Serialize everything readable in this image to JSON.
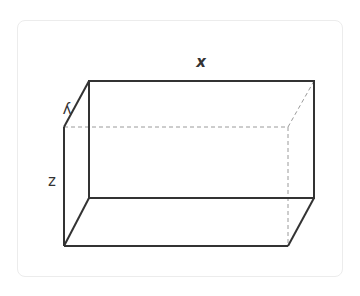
{
  "diagram": {
    "type": "rectangular-prism",
    "labels": {
      "x": "x",
      "y": "y",
      "z": "z"
    },
    "colors": {
      "edge": "#333333",
      "hidden_edge": "#999999",
      "card_border": "#ececec"
    }
  }
}
